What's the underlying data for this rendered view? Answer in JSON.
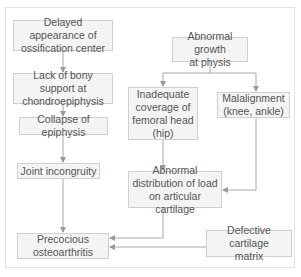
{
  "diagram": {
    "type": "flowchart",
    "colors": {
      "box_fill": "#f4f4f4",
      "box_border": "#cfcfcf",
      "text": "#555555",
      "line": "#a8a8a8"
    },
    "nodes": {
      "delayed_ossification": "Delayed appearance of\nossification center",
      "lack_bony_support": "Lack of bony support at\nchondroepiphysis",
      "collapse_epiphysis": "Collapse of epiphysis",
      "joint_incongruity": "Joint incongruity",
      "precocious_oa": "Precocious\nosteoarthritis",
      "abnormal_growth": "Abnormal growth\nat physis",
      "inadequate_coverage": "Inadequate\ncoverage of\nfemoral head\n(hip)",
      "malalignment": "Malalignment\n(knee, ankle)",
      "abnormal_load": "Abnormal\ndistribution of load\non articular cartilage",
      "defective_matrix": "Defective cartilage\nmatrix"
    },
    "edges": [
      [
        "delayed_ossification",
        "lack_bony_support"
      ],
      [
        "lack_bony_support",
        "collapse_epiphysis"
      ],
      [
        "collapse_epiphysis",
        "joint_incongruity"
      ],
      [
        "joint_incongruity",
        "precocious_oa"
      ],
      [
        "abnormal_growth",
        "inadequate_coverage"
      ],
      [
        "abnormal_growth",
        "malalignment"
      ],
      [
        "inadequate_coverage",
        "abnormal_load"
      ],
      [
        "malalignment",
        "abnormal_load"
      ],
      [
        "abnormal_load",
        "precocious_oa"
      ],
      [
        "defective_matrix",
        "precocious_oa"
      ]
    ]
  }
}
